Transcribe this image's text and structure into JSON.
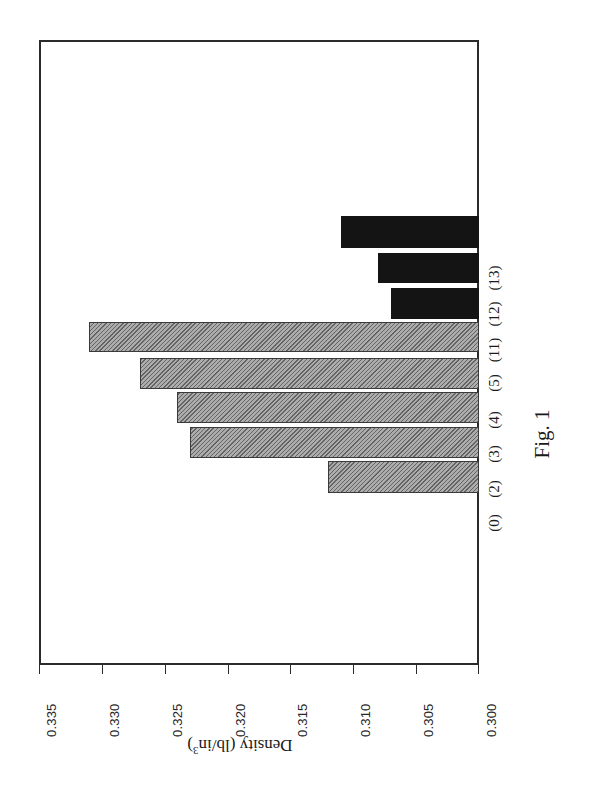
{
  "figure": {
    "caption": "Fig. 1",
    "axis_title_main": "Density (lb/in",
    "axis_title_sup": "3",
    "axis_title_close": ")",
    "frame_color": "#2b2b2b",
    "background": "#ffffff"
  },
  "chart_data": {
    "type": "bar",
    "orientation": "horizontal",
    "title": "",
    "xlabel": "Density (lb/in3)",
    "ylabel": "",
    "xlim": [
      0.3,
      0.335
    ],
    "x_inverted": true,
    "grid": false,
    "legend": "none",
    "baseline": 0.3,
    "xticks": [
      "0.335",
      "0.330",
      "0.325",
      "0.320",
      "0.315",
      "0.310",
      "0.305",
      "0.300"
    ],
    "xtick_values": [
      0.335,
      0.33,
      0.325,
      0.32,
      0.315,
      0.31,
      0.305,
      0.3
    ],
    "categories": [
      "(13)",
      "(12)",
      "(11)",
      "(5)",
      "(4)",
      "(3)",
      "(2)",
      "(0)"
    ],
    "values": [
      0.311,
      0.308,
      0.307,
      0.331,
      0.327,
      0.324,
      0.323,
      0.312
    ],
    "bars": [
      {
        "label": "(13)",
        "value": 0.311,
        "style": "solid",
        "color": "#141414",
        "top": 176,
        "height": 32,
        "length_px": 139
      },
      {
        "label": "(12)",
        "value": 0.308,
        "style": "solid",
        "color": "#141414",
        "top": 213,
        "height": 30,
        "length_px": 100
      },
      {
        "label": "(11)",
        "value": 0.307,
        "style": "solid",
        "color": "#141414",
        "top": 248,
        "height": 31,
        "length_px": 88
      },
      {
        "label": "(5)",
        "value": 0.331,
        "style": "hatched",
        "color": "#8f8f8f",
        "top": 282,
        "height": 30,
        "length_px": 391
      },
      {
        "label": "(4)",
        "value": 0.327,
        "style": "hatched",
        "color": "#8f8f8f",
        "top": 318,
        "height": 31,
        "length_px": 339
      },
      {
        "label": "(3)",
        "value": 0.324,
        "style": "hatched",
        "color": "#8f8f8f",
        "top": 352,
        "height": 31,
        "length_px": 300
      },
      {
        "label": "(2)",
        "value": 0.323,
        "style": "hatched",
        "color": "#8f8f8f",
        "top": 387,
        "height": 31,
        "length_px": 286
      },
      {
        "label": "(0)",
        "value": 0.312,
        "style": "hatched",
        "color": "#8f8f8f",
        "top": 421,
        "height": 32,
        "length_px": 151
      }
    ]
  }
}
